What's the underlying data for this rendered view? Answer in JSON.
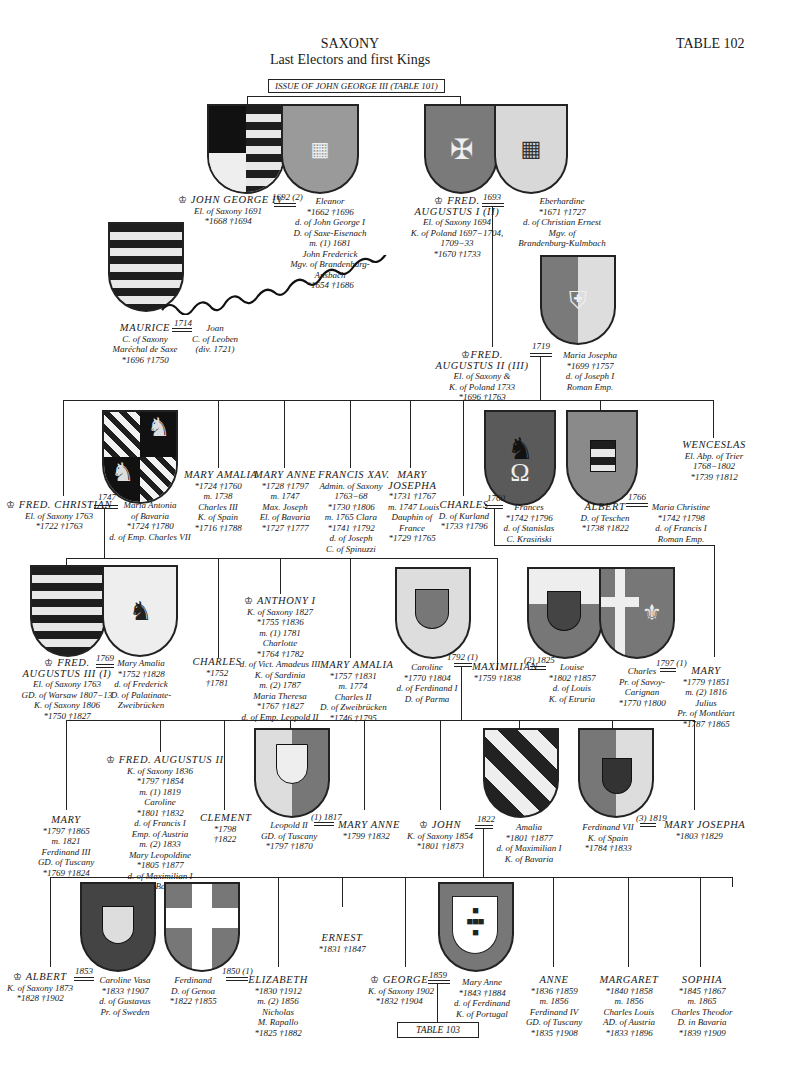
{
  "header": {
    "title": "SAXONY",
    "subtitle": "Last Electors and first Kings",
    "table_number": "TABLE 102",
    "issue_label": "ISSUE OF JOHN GEORGE III (TABLE 101)"
  },
  "icons": {
    "crown": "♔",
    "born": "*",
    "died": "†",
    "marriage": "double-line"
  },
  "gen1": {
    "john_george_iv": {
      "name": "JOHN GEORGE IV",
      "lines": [
        "El. of Saxony 1691",
        "*1668 †1694"
      ]
    },
    "jg4_marriage": "1692 (2)",
    "eleanor": {
      "name": "Eleanor",
      "lines": [
        "*1662 †1696",
        "d. of John George I",
        "D. of Saxe-Eisenach",
        "m. (1) 1681",
        "John Frederick",
        "Mgv. of Brandenburg-",
        "Ansbach",
        "*1654 †1686"
      ]
    },
    "fred_augustus_i": {
      "name": "FRED.",
      "name2": "AUGUSTUS I (II)",
      "lines": [
        "El. of Saxony 1694",
        "K. of Poland 1697−1704,",
        "1709−33",
        "*1670 †1733"
      ]
    },
    "fa1_marriage": "1693",
    "eberhardine": {
      "name": "Eberhardine",
      "lines": [
        "*1671 †1727",
        "d. of Christian Ernest",
        "Mgv. of",
        "Brandenburg-Kulmbach"
      ]
    },
    "maurice": {
      "name": "MAURICE",
      "lines": [
        "C. of Saxony",
        "Maréchal de Saxe",
        "*1696 †1750"
      ]
    },
    "maurice_marriage": "1714",
    "joan": {
      "name": "Joan",
      "lines": [
        "C. of Leoben",
        "(div. 1721)"
      ]
    }
  },
  "gen2": {
    "fred_augustus_ii": {
      "name": "FRED.",
      "name2": "AUGUSTUS II (III)",
      "lines": [
        "El. of Saxony &",
        "K. of Poland 1733",
        "*1696 †1763"
      ]
    },
    "fa2_marriage": "1719",
    "maria_josepha": {
      "name": "Maria Josepha",
      "lines": [
        "*1699 †1757",
        "d. of Joseph I",
        "Roman Emp."
      ]
    }
  },
  "gen3": {
    "fred_christian": {
      "name": "FRED. CHRISTIAN",
      "lines": [
        "El. of Saxony 1763",
        "*1722 †1763"
      ]
    },
    "fc_marriage": "1747",
    "maria_antonia": {
      "name": "Maria Antonia",
      "lines": [
        "of Bavaria",
        "*1724 †1780",
        "d. of Emp. Charles VII"
      ]
    },
    "mary_amalia": {
      "name": "MARY AMALIA",
      "lines": [
        "*1724 †1760",
        "m. 1738",
        "Charles III",
        "K. of Spain",
        "*1716 †1788"
      ]
    },
    "mary_anne": {
      "name": "MARY ANNE",
      "lines": [
        "*1728 †1797",
        "m. 1747",
        "Max. Joseph",
        "El. of Bavaria",
        "*1727 †1777"
      ]
    },
    "francis_xav": {
      "name": "FRANCIS XAV.",
      "lines": [
        "Admin. of Saxony",
        "1763−68",
        "*1730 †1806",
        "m. 1765 Clara",
        "*1741 †1792",
        "d. of Joseph",
        "C. of Spinuzzi"
      ]
    },
    "mary_josepha": {
      "name": "MARY",
      "name2": "JOSEPHA",
      "lines": [
        "*1731 †1767",
        "m. 1747 Louis",
        "Dauphin of",
        "France",
        "*1729 †1765"
      ]
    },
    "charles": {
      "name": "CHARLES",
      "lines": [
        "D. of Kurland",
        "*1733 †1796"
      ]
    },
    "charles_marriage": "1760",
    "frances": {
      "name": "Frances",
      "lines": [
        "*1742 †1796",
        "d. of Stanislas",
        "C. Krasiński"
      ]
    },
    "albert": {
      "name": "ALBERT",
      "lines": [
        "D. of Teschen",
        "*1738 †1822"
      ]
    },
    "albert_marriage": "1766",
    "maria_christine": {
      "name": "Maria Christine",
      "lines": [
        "*1742 †1798",
        "d. of Francis I",
        "Roman Emp."
      ]
    },
    "wenceslas": {
      "name": "WENCESLAS",
      "lines": [
        "El. Abp. of Trier",
        "1768−1802",
        "*1739 †1812"
      ]
    }
  },
  "gen4": {
    "fred_augustus_iii": {
      "name": "FRED.",
      "name2": "AUGUSTUS III (I)",
      "lines": [
        "El. of Saxony 1763",
        "GD. of Warsaw 1807−13",
        "K. of Saxony 1806",
        "*1750 †1827"
      ]
    },
    "fa3_marriage": "1769",
    "mary_amalia_z": {
      "name": "Mary Amalia",
      "lines": [
        "*1752 †1828",
        "d. of Frederick",
        "D. of Palatinate-",
        "Zweibrücken"
      ]
    },
    "charles2": {
      "name": "CHARLES",
      "lines": [
        "*1752",
        "†1781"
      ]
    },
    "anthony_i": {
      "name": "ANTHONY I",
      "lines": [
        "K. of Saxony 1827",
        "*1755 †1836",
        "m. (1) 1781",
        "Charlotte",
        "*1764 †1782",
        "d. of Vict. Amadeus III",
        "K. of Sardinia",
        "m. (2) 1787",
        "Maria Theresa",
        "*1767 †1827",
        "d. of Emp. Leopold II"
      ]
    },
    "mary_amalia2": {
      "name": "MARY AMALIA",
      "lines": [
        "*1757 †1831",
        "m. 1774",
        "Charles II",
        "D. of Zweibrücken",
        "*1746 †1795"
      ]
    },
    "caroline": {
      "name": "Caroline",
      "lines": [
        "*1770 †1804",
        "d. of Ferdinand I",
        "D. of Parma"
      ]
    },
    "max_marriage1": "1792 (1)",
    "maximilian": {
      "name": "MAXIMILIAN",
      "lines": [
        "*1759 †1838"
      ]
    },
    "max_marriage2": "(2) 1825",
    "louise": {
      "name": "Louise",
      "lines": [
        "*1802 †1857",
        "d. of Louis",
        "K. of Etruria"
      ]
    },
    "charles_carignan": {
      "name": "Charles",
      "lines": [
        "Pr. of Savoy-",
        "Carignan",
        "*1770 †1800"
      ]
    },
    "mary_marriage": "1797 (1)",
    "mary": {
      "name": "MARY",
      "lines": [
        "*1779 †1851",
        "m. (2) 1816",
        "Julius",
        "Pr. of Montléart",
        "*1787 †1865"
      ]
    }
  },
  "gen5": {
    "mary": {
      "name": "MARY",
      "lines": [
        "*1797 †1865",
        "m. 1821",
        "Ferdinand III",
        "GD. of Tuscany",
        "*1769 †1824"
      ]
    },
    "fred_augustus_ii_k": {
      "name": "FRED. AUGUSTUS II",
      "lines": [
        "K. of Saxony 1836",
        "*1797 †1854",
        "m. (1) 1819",
        "Caroline",
        "*1801 †1832",
        "d. of Francis I",
        "Emp. of Austria",
        "m. (2) 1833",
        "Mary Leopoldine",
        "*1805 †1877",
        "d. of Maximilian I",
        "K. of Bavaria"
      ]
    },
    "clement": {
      "name": "CLEMENT",
      "lines": [
        "*1798",
        "†1822"
      ]
    },
    "leopold_ii": {
      "name": "Leopold II",
      "lines": [
        "GD. of Tuscany",
        "*1797 †1870"
      ]
    },
    "leopold_marriage": "(1) 1817",
    "mary_anne": {
      "name": "MARY ANNE",
      "lines": [
        "*1799 †1832"
      ]
    },
    "john": {
      "name": "JOHN",
      "lines": [
        "K. of Saxony 1854",
        "*1801 †1873"
      ]
    },
    "john_marriage": "1822",
    "amalia": {
      "name": "Amalia",
      "lines": [
        "*1801 †1877",
        "d. of Maximilian I",
        "K. of Bavaria"
      ]
    },
    "ferdinand_vii": {
      "name": "Ferdinand VII",
      "lines": [
        "K. of Spain",
        "*1784 †1833"
      ]
    },
    "ferd_marriage": "(3) 1819",
    "mary_josepha": {
      "name": "MARY JOSEPHA",
      "lines": [
        "*1803 †1829"
      ]
    }
  },
  "gen6": {
    "albert": {
      "name": "ALBERT",
      "lines": [
        "K. of Saxony 1873",
        "*1828 †1902"
      ]
    },
    "albert_marriage": "1853",
    "caroline_vasa": {
      "name": "Caroline Vasa",
      "lines": [
        "*1833 †1907",
        "d. of Gustavus",
        "Pr. of Sweden"
      ]
    },
    "ferdinand_genoa": {
      "name": "Ferdinand",
      "lines": [
        "D. of Genoa",
        "*1822 †1855"
      ]
    },
    "eliz_marriage": "1850 (1)",
    "elizabeth": {
      "name": "ELIZABETH",
      "lines": [
        "*1830 †1912",
        "m. (2) 1856",
        "Nicholas",
        "M. Rapallo",
        "*1825 †1882"
      ]
    },
    "ernest": {
      "name": "ERNEST",
      "lines": [
        "*1831 †1847"
      ]
    },
    "george": {
      "name": "GEORGE",
      "lines": [
        "K. of Saxony 1902",
        "*1832 †1904"
      ]
    },
    "george_marriage": "1859",
    "mary_anne_portugal": {
      "name": "Mary Anne",
      "lines": [
        "*1843 †1884",
        "d. of Ferdinand",
        "K. of Portugal"
      ]
    },
    "anne": {
      "name": "ANNE",
      "lines": [
        "*1836 †1859",
        "m. 1856",
        "Ferdinand IV",
        "GD. of Tuscany",
        "*1835 †1908"
      ]
    },
    "margaret": {
      "name": "MARGARET",
      "lines": [
        "*1840 †1858",
        "m. 1856",
        "Charles Louis",
        "AD. of Austria",
        "*1833 †1896"
      ]
    },
    "sophia": {
      "name": "SOPHIA",
      "lines": [
        "*1845 †1867",
        "m. 1865",
        "Charles Theodor",
        "D. in Bavaria",
        "*1839 †1909"
      ]
    },
    "next_table": "TABLE 103"
  },
  "colors": {
    "ink": "#1a1a1a",
    "shield_grey": "#7a7a7a",
    "shield_light": "#e8e8e8",
    "paper": "#ffffff"
  }
}
